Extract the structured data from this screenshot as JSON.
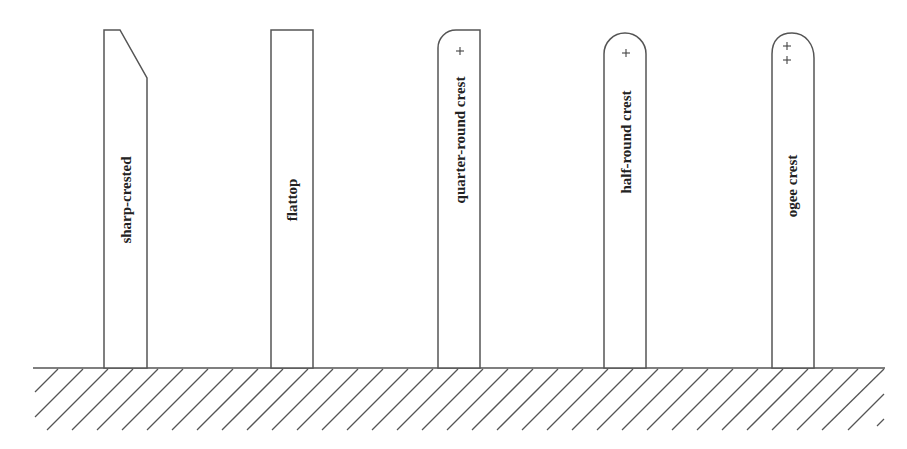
{
  "diagram": {
    "title": "",
    "posts": [
      {
        "id": "sharp-crested",
        "label": "sharp-crested",
        "crest_type": "sharp",
        "center_marks": 0
      },
      {
        "id": "flattop",
        "label": "flattop",
        "crest_type": "flat",
        "center_marks": 0
      },
      {
        "id": "quarter-round",
        "label": "quarter-round crest",
        "crest_type": "quarter-round",
        "center_marks": 1
      },
      {
        "id": "half-round",
        "label": "half-round crest",
        "crest_type": "half-round",
        "center_marks": 1
      },
      {
        "id": "ogee",
        "label": "ogee crest",
        "crest_type": "ogee",
        "center_marks": 2
      }
    ],
    "ground": {
      "pattern": "diagonal-hatch"
    },
    "colors": {
      "stroke": "#555555",
      "text": "#222222",
      "background": "#ffffff"
    }
  }
}
